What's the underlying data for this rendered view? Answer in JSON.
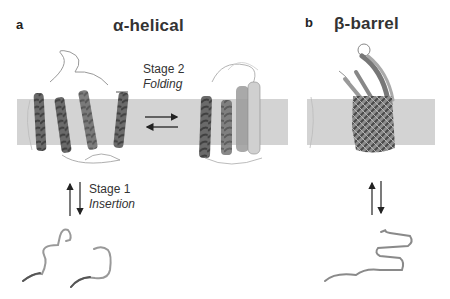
{
  "figure": {
    "panels": [
      {
        "letter": "a",
        "title": "α-helical",
        "stages": [
          {
            "name": "Stage 2",
            "process": "Folding",
            "arrows": "horizontal-equilibrium"
          },
          {
            "name": "Stage 1",
            "process": "Insertion",
            "arrows": "vertical-equilibrium"
          }
        ],
        "states": [
          "unfolded-chain-in-solution",
          "inserted-helices-in-membrane",
          "folded-helical-bundle"
        ]
      },
      {
        "letter": "b",
        "title": "β-barrel",
        "stages": [
          {
            "name": "",
            "process": "",
            "arrows": "vertical-equilibrium"
          }
        ],
        "states": [
          "unfolded-chain-in-solution",
          "folded-beta-barrel-in-membrane"
        ]
      }
    ],
    "colors": {
      "membrane": "#d3d3d3",
      "helix_dark": "#555555",
      "helix_light": "#9a9a9a",
      "chain": "#8a8a8a",
      "arrow": "#222222"
    }
  }
}
